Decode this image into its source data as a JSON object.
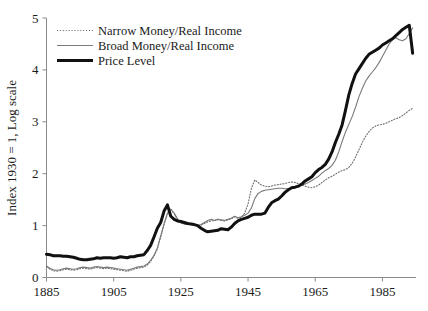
{
  "chart_data": {
    "type": "line",
    "title": "",
    "subtitle": "",
    "xlabel": "",
    "ylabel": "Index 1930 = 1, Log scale",
    "xlim": [
      1885,
      1995
    ],
    "ylim": [
      0,
      5
    ],
    "xticks": [
      1885,
      1905,
      1925,
      1945,
      1965,
      1985
    ],
    "xtick_labels": [
      "1885",
      "1905",
      "1925",
      "1945",
      "1965",
      "1985"
    ],
    "yticks": [
      0,
      1,
      2,
      3,
      4,
      5
    ],
    "ytick_labels": [
      "0",
      "1",
      "2",
      "3",
      "4",
      "5"
    ],
    "grid": false,
    "legend_position": "top-left",
    "legend": [
      {
        "name": "Narrow Money/Real Income",
        "style": "dotted",
        "color": "#6e6e6e",
        "width": 1.1
      },
      {
        "name": "Broad Money/Real Income",
        "style": "solid",
        "color": "#7a7a7a",
        "width": 1.1
      },
      {
        "name": "Price Level",
        "style": "solid",
        "color": "#111111",
        "width": 3.0
      }
    ],
    "series": [
      {
        "name": "Narrow Money/Real Income",
        "style": "dotted",
        "color": "#6e6e6e",
        "width": 1.1,
        "x": [
          1885,
          1886,
          1887,
          1888,
          1889,
          1890,
          1891,
          1892,
          1893,
          1894,
          1895,
          1896,
          1897,
          1898,
          1899,
          1900,
          1901,
          1902,
          1903,
          1904,
          1905,
          1906,
          1907,
          1908,
          1909,
          1910,
          1911,
          1912,
          1913,
          1914,
          1915,
          1916,
          1917,
          1918,
          1919,
          1920,
          1921,
          1922,
          1923,
          1924,
          1925,
          1926,
          1927,
          1928,
          1929,
          1930,
          1931,
          1932,
          1933,
          1934,
          1935,
          1936,
          1937,
          1938,
          1939,
          1940,
          1941,
          1942,
          1943,
          1944,
          1945,
          1946,
          1947,
          1948,
          1949,
          1950,
          1951,
          1952,
          1953,
          1954,
          1955,
          1956,
          1957,
          1958,
          1959,
          1960,
          1961,
          1962,
          1963,
          1964,
          1965,
          1966,
          1967,
          1968,
          1969,
          1970,
          1971,
          1972,
          1973,
          1974,
          1975,
          1976,
          1977,
          1978,
          1979,
          1980,
          1981,
          1982,
          1983,
          1984,
          1985,
          1986,
          1987,
          1988,
          1989,
          1990,
          1991,
          1992,
          1993,
          1994
        ],
        "y": [
          0.21,
          0.16,
          0.13,
          0.12,
          0.13,
          0.15,
          0.16,
          0.15,
          0.14,
          0.15,
          0.17,
          0.18,
          0.17,
          0.16,
          0.18,
          0.19,
          0.18,
          0.17,
          0.18,
          0.17,
          0.16,
          0.15,
          0.14,
          0.13,
          0.12,
          0.14,
          0.16,
          0.18,
          0.19,
          0.2,
          0.24,
          0.31,
          0.41,
          0.55,
          0.78,
          1.02,
          1.22,
          1.31,
          1.23,
          1.12,
          1.06,
          1.04,
          1.03,
          1.03,
          1.02,
          1.0,
          1.01,
          1.04,
          1.07,
          1.09,
          1.1,
          1.12,
          1.1,
          1.09,
          1.11,
          1.13,
          1.17,
          1.14,
          1.16,
          1.24,
          1.42,
          1.72,
          1.88,
          1.83,
          1.78,
          1.76,
          1.75,
          1.76,
          1.78,
          1.79,
          1.8,
          1.81,
          1.83,
          1.84,
          1.83,
          1.81,
          1.79,
          1.76,
          1.74,
          1.73,
          1.75,
          1.78,
          1.83,
          1.88,
          1.92,
          1.95,
          1.99,
          2.03,
          2.06,
          2.08,
          2.12,
          2.2,
          2.32,
          2.46,
          2.6,
          2.72,
          2.81,
          2.88,
          2.92,
          2.94,
          2.95,
          2.97,
          3.0,
          3.03,
          3.06,
          3.08,
          3.12,
          3.17,
          3.22,
          3.26
        ]
      },
      {
        "name": "Broad Money/Real Income",
        "style": "solid",
        "color": "#7a7a7a",
        "width": 1.1,
        "x": [
          1885,
          1886,
          1887,
          1888,
          1889,
          1890,
          1891,
          1892,
          1893,
          1894,
          1895,
          1896,
          1897,
          1898,
          1899,
          1900,
          1901,
          1902,
          1903,
          1904,
          1905,
          1906,
          1907,
          1908,
          1909,
          1910,
          1911,
          1912,
          1913,
          1914,
          1915,
          1916,
          1917,
          1918,
          1919,
          1920,
          1921,
          1922,
          1923,
          1924,
          1925,
          1926,
          1927,
          1928,
          1929,
          1930,
          1931,
          1932,
          1933,
          1934,
          1935,
          1936,
          1937,
          1938,
          1939,
          1940,
          1941,
          1942,
          1943,
          1944,
          1945,
          1946,
          1947,
          1948,
          1949,
          1950,
          1951,
          1952,
          1953,
          1954,
          1955,
          1956,
          1957,
          1958,
          1959,
          1960,
          1961,
          1962,
          1963,
          1964,
          1965,
          1966,
          1967,
          1968,
          1969,
          1970,
          1971,
          1972,
          1973,
          1974,
          1975,
          1976,
          1977,
          1978,
          1979,
          1980,
          1981,
          1982,
          1983,
          1984,
          1985,
          1986,
          1987,
          1988,
          1989,
          1990,
          1991,
          1992,
          1993,
          1994
        ],
        "y": [
          0.22,
          0.18,
          0.15,
          0.14,
          0.15,
          0.17,
          0.18,
          0.17,
          0.16,
          0.17,
          0.19,
          0.2,
          0.19,
          0.18,
          0.2,
          0.21,
          0.2,
          0.19,
          0.2,
          0.19,
          0.18,
          0.17,
          0.16,
          0.15,
          0.14,
          0.16,
          0.18,
          0.2,
          0.21,
          0.22,
          0.26,
          0.33,
          0.43,
          0.57,
          0.8,
          1.04,
          1.24,
          1.32,
          1.24,
          1.13,
          1.05,
          1.03,
          1.02,
          1.02,
          1.01,
          1.0,
          1.02,
          1.06,
          1.1,
          1.12,
          1.1,
          1.12,
          1.11,
          1.1,
          1.12,
          1.14,
          1.18,
          1.15,
          1.17,
          1.2,
          1.24,
          1.34,
          1.52,
          1.62,
          1.66,
          1.68,
          1.69,
          1.7,
          1.71,
          1.72,
          1.72,
          1.71,
          1.71,
          1.72,
          1.74,
          1.76,
          1.78,
          1.8,
          1.83,
          1.87,
          1.91,
          1.95,
          2.01,
          2.06,
          2.1,
          2.16,
          2.26,
          2.42,
          2.62,
          2.8,
          2.95,
          3.1,
          3.28,
          3.48,
          3.64,
          3.78,
          3.88,
          3.96,
          4.04,
          4.14,
          4.26,
          4.38,
          4.5,
          4.58,
          4.62,
          4.58,
          4.56,
          4.6,
          4.7,
          4.81
        ]
      },
      {
        "name": "Price Level",
        "style": "solid",
        "color": "#111111",
        "width": 3.0,
        "x": [
          1885,
          1886,
          1887,
          1888,
          1889,
          1890,
          1891,
          1892,
          1893,
          1894,
          1895,
          1896,
          1897,
          1898,
          1899,
          1900,
          1901,
          1902,
          1903,
          1904,
          1905,
          1906,
          1907,
          1908,
          1909,
          1910,
          1911,
          1912,
          1913,
          1914,
          1915,
          1916,
          1917,
          1918,
          1919,
          1920,
          1921,
          1922,
          1923,
          1924,
          1925,
          1926,
          1927,
          1928,
          1929,
          1930,
          1931,
          1932,
          1933,
          1934,
          1935,
          1936,
          1937,
          1938,
          1939,
          1940,
          1941,
          1942,
          1943,
          1944,
          1945,
          1946,
          1947,
          1948,
          1949,
          1950,
          1951,
          1952,
          1953,
          1954,
          1955,
          1956,
          1957,
          1958,
          1959,
          1960,
          1961,
          1962,
          1963,
          1964,
          1965,
          1966,
          1967,
          1968,
          1969,
          1970,
          1971,
          1972,
          1973,
          1974,
          1975,
          1976,
          1977,
          1978,
          1979,
          1980,
          1981,
          1982,
          1983,
          1984,
          1985,
          1986,
          1987,
          1988,
          1989,
          1990,
          1991,
          1992,
          1993,
          1994
        ],
        "y": [
          0.45,
          0.44,
          0.42,
          0.42,
          0.42,
          0.41,
          0.41,
          0.4,
          0.39,
          0.37,
          0.35,
          0.34,
          0.34,
          0.35,
          0.36,
          0.38,
          0.37,
          0.38,
          0.38,
          0.38,
          0.37,
          0.38,
          0.4,
          0.39,
          0.38,
          0.4,
          0.4,
          0.42,
          0.43,
          0.44,
          0.52,
          0.62,
          0.78,
          0.95,
          1.06,
          1.28,
          1.4,
          1.18,
          1.12,
          1.09,
          1.08,
          1.06,
          1.04,
          1.03,
          1.02,
          1.0,
          0.95,
          0.91,
          0.88,
          0.89,
          0.9,
          0.91,
          0.94,
          0.93,
          0.92,
          0.97,
          1.04,
          1.09,
          1.12,
          1.14,
          1.16,
          1.2,
          1.22,
          1.22,
          1.22,
          1.24,
          1.35,
          1.44,
          1.48,
          1.51,
          1.57,
          1.64,
          1.69,
          1.73,
          1.74,
          1.76,
          1.8,
          1.86,
          1.9,
          1.94,
          2.02,
          2.08,
          2.12,
          2.18,
          2.28,
          2.42,
          2.6,
          2.76,
          2.94,
          3.22,
          3.52,
          3.74,
          3.92,
          4.02,
          4.12,
          4.22,
          4.3,
          4.34,
          4.38,
          4.42,
          4.48,
          4.52,
          4.56,
          4.6,
          4.66,
          4.72,
          4.78,
          4.82,
          4.86,
          4.32
        ]
      }
    ]
  },
  "axes": {
    "y_title": "Index 1930 = 1, Log scale",
    "x_tick_labels": [
      "1885",
      "1905",
      "1925",
      "1945",
      "1965",
      "1985"
    ],
    "y_tick_labels": [
      "0",
      "1",
      "2",
      "3",
      "4",
      "5"
    ]
  },
  "legend_entries": [
    {
      "label": "Narrow Money/Real Income"
    },
    {
      "label": "Broad Money/Real Income"
    },
    {
      "label": "Price Level"
    }
  ]
}
